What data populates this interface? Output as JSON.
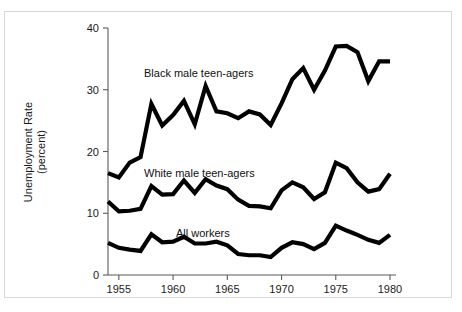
{
  "figure": {
    "background_color": "#ffffff",
    "line_color": "#000000",
    "axis_color": "#5a5a5a"
  },
  "axis": {
    "y_title_line1": "Unemployment Rate",
    "y_title_line2": "(percent)",
    "y_ticks": [
      "0",
      "10",
      "20",
      "30",
      "40"
    ],
    "x_ticks": [
      "1955",
      "1960",
      "1965",
      "1970",
      "1975",
      "1980"
    ]
  },
  "annotations": {
    "black": "Black male teen-agers",
    "white": "White male teen-agers",
    "all": "All workers"
  },
  "chart_data": {
    "type": "line",
    "title": "",
    "xlabel": "",
    "ylabel": "Unemployment Rate (percent)",
    "xlim": [
      1954,
      1980
    ],
    "ylim": [
      0,
      40
    ],
    "yticks": [
      0,
      10,
      20,
      30,
      40
    ],
    "xticks": [
      1955,
      1960,
      1965,
      1970,
      1975,
      1980
    ],
    "grid": false,
    "legend_position": "inline-annotations",
    "x": [
      1954,
      1955,
      1956,
      1957,
      1958,
      1959,
      1960,
      1961,
      1962,
      1963,
      1964,
      1965,
      1966,
      1967,
      1968,
      1969,
      1970,
      1971,
      1972,
      1973,
      1974,
      1975,
      1976,
      1977,
      1978,
      1979,
      1980
    ],
    "series": [
      {
        "name": "Black male teen-agers",
        "color": "#000000",
        "values": [
          16.5,
          15.8,
          18.2,
          19.1,
          27.7,
          24.2,
          25.9,
          28.2,
          24.4,
          30.6,
          26.5,
          26.2,
          25.4,
          26.5,
          26.0,
          24.3,
          27.8,
          31.7,
          33.5,
          30.0,
          33.1,
          37.0,
          37.1,
          36.1,
          31.4,
          34.6,
          34.6
        ]
      },
      {
        "name": "White male teen-agers",
        "color": "#000000",
        "values": [
          11.9,
          10.3,
          10.4,
          10.7,
          14.4,
          13.0,
          13.1,
          15.3,
          13.3,
          15.5,
          14.5,
          13.9,
          12.2,
          11.2,
          11.1,
          10.8,
          13.7,
          15.0,
          14.2,
          12.3,
          13.4,
          18.2,
          17.3,
          15.0,
          13.5,
          13.9,
          16.4
        ]
      },
      {
        "name": "All workers",
        "color": "#000000",
        "values": [
          5.2,
          4.4,
          4.1,
          3.9,
          6.6,
          5.3,
          5.4,
          6.2,
          5.1,
          5.1,
          5.4,
          4.8,
          3.4,
          3.2,
          3.2,
          2.9,
          4.4,
          5.3,
          5.0,
          4.2,
          5.2,
          8.0,
          7.2,
          6.5,
          5.7,
          5.2,
          6.5
        ]
      }
    ]
  }
}
